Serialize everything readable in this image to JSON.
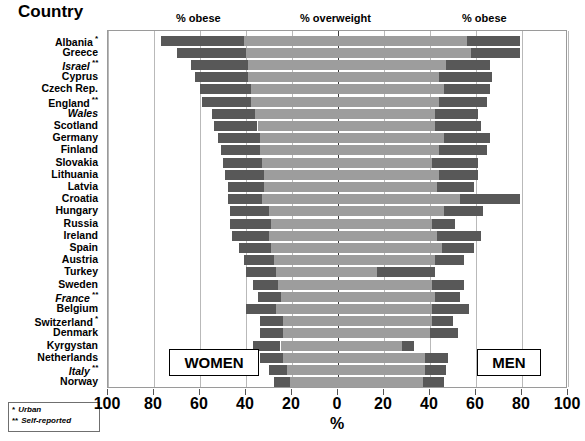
{
  "title": "Country",
  "headers": {
    "obese_left": "% obese",
    "overweight": "% overweight",
    "obese_right": "% obese"
  },
  "tags": {
    "women": "WOMEN",
    "men": "MEN"
  },
  "footnotes": [
    {
      "mark": "*",
      "text": "Urban"
    },
    {
      "mark": "**",
      "text": "Self-reported"
    }
  ],
  "axis": {
    "label": "%",
    "ticks": [
      100,
      80,
      60,
      40,
      20,
      0,
      20,
      40,
      60,
      80,
      100
    ],
    "min": -100,
    "max": 100,
    "zero": 0
  },
  "colors": {
    "obese": "#585858",
    "overweight": "#9d9d9d",
    "frame": "#9a9a9a",
    "gridline": "#b9b9b9",
    "zeroline": "#3a3a3a",
    "background": "#ffffff"
  },
  "chart_data": {
    "type": "bar",
    "orientation": "horizontal",
    "style": "diverging-stacked-population-pyramid",
    "title": "Country",
    "xlabel": "%",
    "ylabel": "Country",
    "xlim": [
      -100,
      100
    ],
    "grid": true,
    "legend_position": "top",
    "legend": [
      "% obese",
      "% overweight",
      "% obese"
    ],
    "group_labels": {
      "left": "WOMEN",
      "right": "MEN"
    },
    "series_names": [
      "women_obese",
      "women_overweight",
      "men_overweight",
      "men_obese"
    ],
    "categories": [
      "Albania",
      "Greece",
      "Israel",
      "Cyprus",
      "Czech Rep.",
      "England",
      "Wales",
      "Scotland",
      "Germany",
      "Finland",
      "Slovakia",
      "Lithuania",
      "Latvia",
      "Croatia",
      "Hungary",
      "Russia",
      "Ireland",
      "Spain",
      "Austria",
      "Turkey",
      "Sweden",
      "France",
      "Belgium",
      "Switzerland",
      "Denmark",
      "Kyrgystan",
      "Netherlands",
      "Italy",
      "Norway"
    ],
    "rows": [
      {
        "country": "Albania",
        "note": "*",
        "italic": false,
        "women_obese": 36,
        "women_overweight": 41,
        "men_overweight": 56,
        "men_obese": 23
      },
      {
        "country": "Greece",
        "note": "",
        "italic": false,
        "women_obese": 30,
        "women_overweight": 40,
        "men_overweight": 58,
        "men_obese": 21
      },
      {
        "country": "Israel",
        "note": "**",
        "italic": true,
        "women_obese": 25,
        "women_overweight": 39,
        "men_overweight": 47,
        "men_obese": 19
      },
      {
        "country": "Cyprus",
        "note": "",
        "italic": false,
        "women_obese": 23,
        "women_overweight": 39,
        "men_overweight": 44,
        "men_obese": 23
      },
      {
        "country": "Czech Rep.",
        "note": "",
        "italic": false,
        "women_obese": 22,
        "women_overweight": 38,
        "men_overweight": 46,
        "men_obese": 20
      },
      {
        "country": "England",
        "note": "**",
        "italic": false,
        "women_obese": 21,
        "women_overweight": 38,
        "men_overweight": 44,
        "men_obese": 21
      },
      {
        "country": "Wales",
        "note": "",
        "italic": true,
        "women_obese": 19,
        "women_overweight": 36,
        "men_overweight": 42,
        "men_obese": 19
      },
      {
        "country": "Scotland",
        "note": "",
        "italic": false,
        "women_obese": 19,
        "women_overweight": 35,
        "men_overweight": 42,
        "men_obese": 20
      },
      {
        "country": "Germany",
        "note": "",
        "italic": false,
        "women_obese": 18,
        "women_overweight": 34,
        "men_overweight": 46,
        "men_obese": 20
      },
      {
        "country": "Finland",
        "note": "",
        "italic": false,
        "women_obese": 17,
        "women_overweight": 34,
        "men_overweight": 44,
        "men_obese": 21
      },
      {
        "country": "Slovakia",
        "note": "",
        "italic": false,
        "women_obese": 17,
        "women_overweight": 33,
        "men_overweight": 41,
        "men_obese": 20
      },
      {
        "country": "Lithuania",
        "note": "",
        "italic": false,
        "women_obese": 17,
        "women_overweight": 32,
        "men_overweight": 44,
        "men_obese": 17
      },
      {
        "country": "Latvia",
        "note": "",
        "italic": false,
        "women_obese": 16,
        "women_overweight": 32,
        "men_overweight": 43,
        "men_obese": 16
      },
      {
        "country": "Croatia",
        "note": "",
        "italic": false,
        "women_obese": 15,
        "women_overweight": 33,
        "men_overweight": 53,
        "men_obese": 26
      },
      {
        "country": "Hungary",
        "note": "",
        "italic": false,
        "women_obese": 17,
        "women_overweight": 30,
        "men_overweight": 46,
        "men_obese": 17
      },
      {
        "country": "Russia",
        "note": "",
        "italic": false,
        "women_obese": 18,
        "women_overweight": 29,
        "men_overweight": 41,
        "men_obese": 10
      },
      {
        "country": "Ireland",
        "note": "",
        "italic": false,
        "women_obese": 16,
        "women_overweight": 30,
        "men_overweight": 43,
        "men_obese": 19
      },
      {
        "country": "Spain",
        "note": "",
        "italic": false,
        "women_obese": 14,
        "women_overweight": 29,
        "men_overweight": 45,
        "men_obese": 14
      },
      {
        "country": "Austria",
        "note": "",
        "italic": false,
        "women_obese": 13,
        "women_overweight": 28,
        "men_overweight": 42,
        "men_obese": 13
      },
      {
        "country": "Turkey",
        "note": "",
        "italic": false,
        "women_obese": 13,
        "women_overweight": 27,
        "men_overweight": 17,
        "men_obese": 25
      },
      {
        "country": "Sweden",
        "note": "",
        "italic": false,
        "women_obese": 11,
        "women_overweight": 26,
        "men_overweight": 41,
        "men_obese": 14
      },
      {
        "country": "France",
        "note": "**",
        "italic": true,
        "women_obese": 10,
        "women_overweight": 25,
        "men_overweight": 42,
        "men_obese": 11
      },
      {
        "country": "Belgium",
        "note": "",
        "italic": false,
        "women_obese": 13,
        "women_overweight": 27,
        "men_overweight": 41,
        "men_obese": 16
      },
      {
        "country": "Switzerland",
        "note": "*",
        "italic": false,
        "women_obese": 10,
        "women_overweight": 24,
        "men_overweight": 41,
        "men_obese": 9
      },
      {
        "country": "Denmark",
        "note": "",
        "italic": false,
        "women_obese": 10,
        "women_overweight": 24,
        "men_overweight": 40,
        "men_obese": 12
      },
      {
        "country": "Kyrgystan",
        "note": "",
        "italic": false,
        "women_obese": 12,
        "women_overweight": 25,
        "men_overweight": 28,
        "men_obese": 5
      },
      {
        "country": "Netherlands",
        "note": "",
        "italic": false,
        "women_obese": 10,
        "women_overweight": 24,
        "men_overweight": 38,
        "men_obese": 10
      },
      {
        "country": "Italy",
        "note": "**",
        "italic": true,
        "women_obese": 8,
        "women_overweight": 22,
        "men_overweight": 38,
        "men_obese": 9
      },
      {
        "country": "Norway",
        "note": "",
        "italic": false,
        "women_obese": 7,
        "women_overweight": 21,
        "men_overweight": 37,
        "men_obese": 9
      }
    ]
  }
}
